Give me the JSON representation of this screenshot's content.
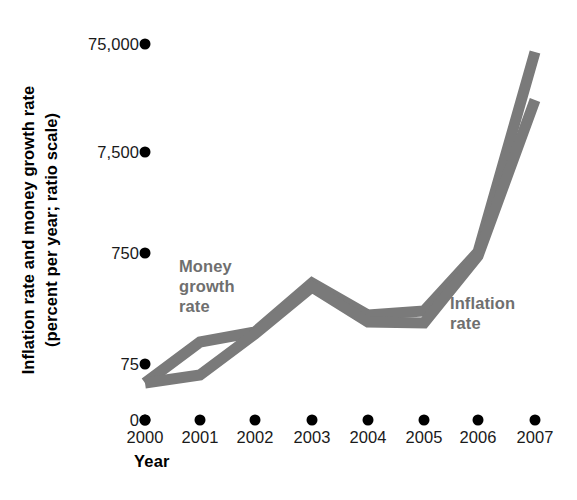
{
  "chart_data": {
    "type": "line",
    "title": "",
    "xlabel": "Year",
    "ylabel": "Inflation rate and money growth rate (percent per year; ratio scale)",
    "scale": "log",
    "grid": false,
    "legend_position": "inline",
    "categories": [
      "2000",
      "2001",
      "2002",
      "2003",
      "2004",
      "2005",
      "2006",
      "2007"
    ],
    "ytick_labels": [
      "75,000",
      "7,500",
      "750",
      "75",
      "0"
    ],
    "ytick_values": [
      75000,
      7500,
      750,
      75,
      0
    ],
    "series": [
      {
        "name": "Money growth rate",
        "values": [
          50,
          110,
          160,
          500,
          250,
          270,
          750,
          75000
        ],
        "color": "#7a7a7a"
      },
      {
        "name": "Inflation rate",
        "values": [
          50,
          62,
          160,
          500,
          250,
          215,
          750,
          25000
        ],
        "color": "#7a7a7a"
      }
    ]
  },
  "axis": {
    "y_title_line1": "Inflation rate and money growth rate",
    "y_title_line2": "(percent per year; ratio scale)",
    "x_title": "Year"
  },
  "labels": {
    "money_growth": "Money\ngrowth\nrate",
    "inflation": "Inflation\nrate"
  },
  "colors": {
    "line": "#7a7a7a",
    "label": "#6f6f6f",
    "axis_text": "#1a1a1a",
    "dot": "#000000",
    "background": "#ffffff"
  },
  "geometry": {
    "y_px": {
      "75000": 44,
      "7500": 152,
      "750": 253,
      "75": 364,
      "0": 420
    },
    "x_px": [
      145,
      200,
      255,
      312,
      368,
      424,
      478,
      535
    ],
    "money_y_px": [
      383,
      342,
      332,
      283,
      315,
      311,
      252,
      52
    ],
    "inflation_y_px": [
      383,
      375,
      334,
      287,
      322,
      323,
      256,
      100
    ]
  }
}
